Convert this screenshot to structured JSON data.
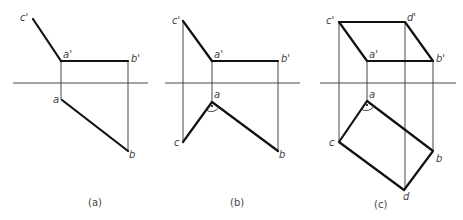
{
  "figure": {
    "panels": [
      {
        "id": "a",
        "caption": "(a)",
        "labels": {
          "c_prime": "c'",
          "a_prime": "a'",
          "b_prime": "b'",
          "a": "a",
          "b": "b"
        }
      },
      {
        "id": "b",
        "caption": "(b)",
        "labels": {
          "c_prime": "c'",
          "a_prime": "a'",
          "b_prime": "b'",
          "a": "a",
          "b": "b",
          "c": "c"
        }
      },
      {
        "id": "c",
        "caption": "(c)",
        "labels": {
          "c_prime": "c'",
          "d_prime": "d'",
          "a_prime": "a'",
          "b_prime": "b'",
          "a": "a",
          "b": "b",
          "c": "c",
          "d": "d"
        }
      }
    ],
    "line_color": "#111111",
    "thin_line_color": "#333333"
  }
}
